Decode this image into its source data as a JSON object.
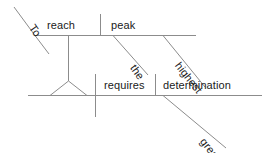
{
  "diagram": {
    "type": "reed-kellogg-sentence-diagram",
    "sentence": "To reach the highest peak requires great determination.",
    "canvas": {
      "width": 271,
      "height": 153
    },
    "style": {
      "line_color": "#8c8c8c",
      "text_color": "#1a1a1a",
      "background_color": "#ffffff",
      "line_width": "1"
    },
    "words": {
      "to": "To",
      "reach": "reach",
      "peak": "peak",
      "the": "the",
      "highest": "highest",
      "requires": "requires",
      "determination": "determination",
      "great": "great"
    },
    "clauses": {
      "infinitive_phrase": {
        "verb": "reach",
        "object": "peak",
        "marker": "To",
        "object_modifiers": [
          "the",
          "highest"
        ]
      },
      "main_clause": {
        "subject": "(infinitive phrase)",
        "predicate": "requires",
        "object": "determination",
        "object_modifiers": [
          "great"
        ]
      }
    }
  }
}
